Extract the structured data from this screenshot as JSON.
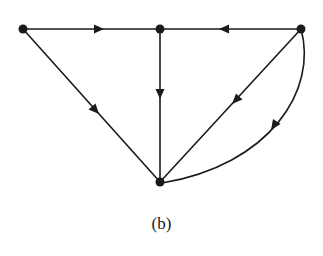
{
  "figure": {
    "caption": "(b)",
    "stroke_color": "#1a1a1a",
    "background": "#ffffff"
  },
  "graph": {
    "directed": true,
    "nodes": [
      {
        "id": "v1",
        "x": 23,
        "y": 29,
        "position": "top-left"
      },
      {
        "id": "v2",
        "x": 160,
        "y": 29,
        "position": "top-middle"
      },
      {
        "id": "v3",
        "x": 301,
        "y": 29,
        "position": "top-right"
      },
      {
        "id": "v4",
        "x": 160,
        "y": 182,
        "position": "bottom"
      }
    ],
    "edges": [
      {
        "from": "v1",
        "to": "v2",
        "shape": "straight"
      },
      {
        "from": "v3",
        "to": "v2",
        "shape": "straight"
      },
      {
        "from": "v2",
        "to": "v4",
        "shape": "straight"
      },
      {
        "from": "v1",
        "to": "v4",
        "shape": "straight"
      },
      {
        "from": "v3",
        "to": "v4",
        "shape": "straight"
      },
      {
        "from": "v3",
        "to": "v4",
        "shape": "curved"
      }
    ]
  }
}
